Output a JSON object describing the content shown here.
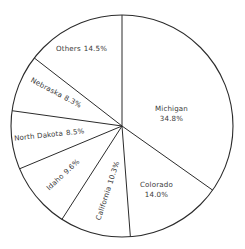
{
  "chart_data": {
    "type": "pie",
    "title": "",
    "subtitle": "",
    "xlabel": "",
    "ylabel": "",
    "legend": "none",
    "grid": false,
    "units": "percent",
    "start_angle_deg": 0,
    "direction": "clockwise",
    "categories": [
      "Michigan",
      "Colorado",
      "California",
      "Idaho",
      "North Dakota",
      "Nebraska",
      "Others"
    ],
    "values": [
      34.8,
      14.0,
      10.3,
      9.6,
      8.5,
      8.3,
      14.5
    ],
    "slices": [
      {
        "name": "Michigan",
        "value": 34.8,
        "value_label": "34.8%",
        "label_rotation_deg": 0,
        "label_layout": "stacked",
        "label_x": 155,
        "label_y": 104
      },
      {
        "name": "Colorado",
        "value": 14.0,
        "value_label": "14.0%",
        "label_rotation_deg": 0,
        "label_layout": "stacked",
        "label_x": 140,
        "label_y": 180
      },
      {
        "name": "California",
        "value": 10.3,
        "value_label": "10.3%",
        "label_rotation_deg": -72,
        "label_layout": "inline",
        "label_x": 77,
        "label_y": 186
      },
      {
        "name": "Idaho",
        "value": 9.6,
        "value_label": "9.6%",
        "label_rotation_deg": -43,
        "label_layout": "inline",
        "label_x": 42,
        "label_y": 170
      },
      {
        "name": "North Dakota",
        "value": 8.5,
        "value_label": "8.5%",
        "label_rotation_deg": -6,
        "label_layout": "inline",
        "label_x": 14,
        "label_y": 130
      },
      {
        "name": "Nebraska",
        "value": 8.3,
        "value_label": "8.3%",
        "label_rotation_deg": 28,
        "label_layout": "inline",
        "label_x": 28,
        "label_y": 88
      },
      {
        "name": "Others",
        "value": 14.5,
        "value_label": "14.5%",
        "label_rotation_deg": 0,
        "label_layout": "inline",
        "label_x": 56,
        "label_y": 44
      }
    ],
    "geometry": {
      "center_x": 122,
      "center_y": 126,
      "radius": 111
    },
    "style": {
      "stroke_color": "#2b2b2b",
      "fill_color": "#ffffff",
      "text_color": "#3a3a3a",
      "background": "#ffffff"
    }
  }
}
